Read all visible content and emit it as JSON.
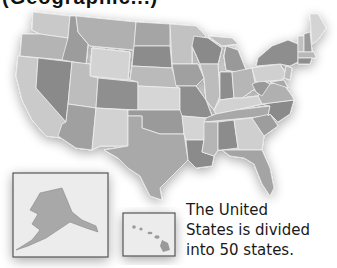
{
  "heading": {
    "text": "(Geographic...)",
    "clipped": true
  },
  "map": {
    "title": "United States map",
    "style": "grayscale political map with drop shadow",
    "colors": {
      "ocean": "#ffffff",
      "shadow": "#d9d9d9",
      "light": "#d4d4d4",
      "mid_light": "#bcbcbc",
      "mid": "#a4a4a4",
      "dark": "#8a8a8a",
      "border": "#f2f2f2",
      "inset_border": "#555555",
      "inset_fill": "#ececec"
    },
    "insets": [
      {
        "name": "Alaska",
        "label": "alaska-inset"
      },
      {
        "name": "Hawaii",
        "label": "hawaii-inset"
      }
    ]
  },
  "caption": {
    "lines": [
      "The United",
      "States is divided",
      "into 50 states."
    ]
  }
}
